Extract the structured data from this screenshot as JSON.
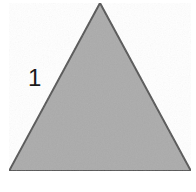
{
  "figure": {
    "type": "geometry-diagram",
    "shape": "triangle",
    "background_color": "#ffffff",
    "triangle": {
      "name": "equilateral-triangle",
      "fill_color": "#ababab",
      "stroke_color": "#555555",
      "stroke_width": 2,
      "vertices": [
        {
          "name": "apex",
          "x": 100,
          "y": 3
        },
        {
          "name": "bottom-left",
          "x": 9,
          "y": 171
        },
        {
          "name": "bottom-right",
          "x": 191,
          "y": 171
        }
      ]
    },
    "labels": [
      {
        "name": "left-side-length",
        "text": "1",
        "side": "left",
        "color": "#1a1a1a",
        "x": 28,
        "y": 66
      }
    ]
  }
}
